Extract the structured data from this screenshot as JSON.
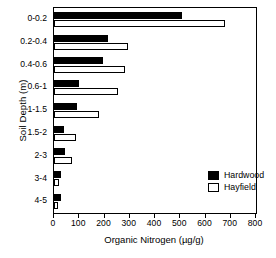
{
  "chart_data": {
    "type": "bar",
    "orientation": "horizontal",
    "title": "",
    "xlabel": "Organic Nitrogen (µg/g)",
    "ylabel": "Soil Depth (m)",
    "xlim": [
      0,
      800
    ],
    "xticks": [
      0,
      100,
      200,
      300,
      400,
      500,
      600,
      700,
      800
    ],
    "xticklabels": [
      "0",
      "100",
      "200",
      "300",
      "400",
      "500",
      "600",
      "700",
      "800"
    ],
    "grid": false,
    "legend_position": "inside-lower-right",
    "categories": [
      "0-0.2",
      "0.2-0.4",
      "0.4-0.6",
      "0.6-1",
      "1-1.5",
      "1.5-2",
      "2-3",
      "3-4",
      "4-5"
    ],
    "series": [
      {
        "name": "Hardwood",
        "color": "#000000",
        "fill": "solid",
        "values": [
          507,
          215,
          195,
          98,
          91,
          40,
          42,
          28,
          28
        ]
      },
      {
        "name": "Hayfield",
        "color": "#ffffff",
        "fill": "open",
        "values": [
          677,
          293,
          281,
          253,
          180,
          89,
          70,
          20,
          17
        ]
      }
    ]
  },
  "legend": {
    "entries": [
      {
        "label": "Hardwood",
        "swatch": "filled-black-square"
      },
      {
        "label": "Hayfield",
        "swatch": "open-white-square"
      }
    ]
  }
}
